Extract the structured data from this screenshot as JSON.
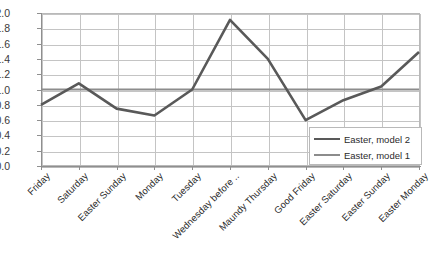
{
  "chart_data": {
    "type": "line",
    "title": "",
    "xlabel": "",
    "ylabel": "",
    "ylim": [
      0.0,
      2.0
    ],
    "ytick_step": 0.2,
    "grid": true,
    "legend_position": "inside-bottom-right",
    "categories": [
      "Friday",
      "Saturday",
      "Easter Sunday",
      "Monday",
      "Tuesday",
      "Wednesday before ..",
      "Maundy Thursday",
      "Good Friday",
      "Easter Saturday",
      "Easter Sunday",
      "Easter Monday"
    ],
    "ytick_labels": [
      "0.0",
      "0.2",
      "0.4",
      "0.6",
      "0.8",
      "1.0",
      "1.2",
      "1.4",
      "1.6",
      "1.8",
      "2.0"
    ],
    "ytick_values": [
      0.0,
      0.2,
      0.4,
      0.6,
      0.8,
      1.0,
      1.2,
      1.4,
      1.6,
      1.8,
      2.0
    ],
    "series": [
      {
        "name": "Easter, model 2",
        "color": "#595959",
        "width": 2.6,
        "values": [
          0.8,
          1.08,
          0.75,
          0.66,
          1.0,
          1.91,
          1.4,
          0.6,
          0.86,
          1.04,
          1.49
        ]
      },
      {
        "name": "Easter, model 1",
        "color": "#8c8c8c",
        "width": 2.2,
        "values": [
          1.0,
          1.0,
          1.0,
          1.0,
          1.0,
          1.0,
          1.0,
          1.0,
          1.0,
          1.0,
          1.0
        ]
      }
    ]
  },
  "legend": {
    "entries": [
      {
        "label": "Easter, model 2"
      },
      {
        "label": "Easter, model 1"
      }
    ]
  },
  "colors": {
    "series2": "#595959",
    "series1": "#8c8c8c",
    "grid": "#c4c4c4",
    "axis": "#8f8f8f",
    "background": "#ffffff"
  }
}
